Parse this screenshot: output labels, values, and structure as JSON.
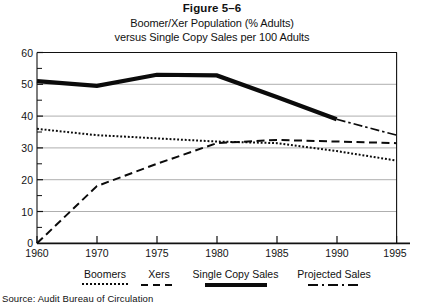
{
  "figure": {
    "number_label": "Figure 5–6",
    "subtitle_line_1": "Boomer/Xer Population (% Adults)",
    "subtitle_line_2": "versus Single Copy Sales per 100 Adults",
    "source_note": "Source: Audit Bureau of Circulation"
  },
  "legend": {
    "position": "bottom",
    "entries": [
      {
        "label": "Boomers",
        "style": "dotted",
        "color": "#0b0b0b"
      },
      {
        "label": "Xers",
        "style": "dashed",
        "color": "#0b0b0b"
      },
      {
        "label": "Single Copy Sales",
        "style": "solid-thick",
        "color": "#0b0b0b"
      },
      {
        "label": "Projected Sales",
        "style": "dash-dot",
        "color": "#0b0b0b"
      }
    ]
  },
  "chart_data": {
    "type": "line",
    "title": "Boomer/Xer Population (% Adults) versus Single Copy Sales per 100 Adults",
    "subtitle": "Figure 5–6",
    "xlabel": "",
    "ylabel": "",
    "x": [
      1960,
      1970,
      1975,
      1980,
      1985,
      1990,
      1995
    ],
    "categories": [
      "1960",
      "1970",
      "1975",
      "1980",
      "1985",
      "1990",
      "1995"
    ],
    "xtick_labels": [
      "1960",
      "1970",
      "1975",
      "1980",
      "1985",
      "1990",
      "1995"
    ],
    "ytick_labels": [
      "0",
      "10",
      "20",
      "30",
      "40",
      "50",
      "60"
    ],
    "ylim": [
      0,
      60
    ],
    "ytick_step": 10,
    "y_minor_step": 5,
    "grid": true,
    "grid_axis": "y",
    "legend_position": "bottom",
    "series": [
      {
        "name": "Single Copy Sales",
        "style": "solid-thick",
        "x": [
          1960,
          1970,
          1975,
          1980,
          1985,
          1990
        ],
        "values": [
          51,
          49.5,
          53,
          52.8,
          46,
          39
        ]
      },
      {
        "name": "Projected Sales",
        "style": "dash-dot",
        "x": [
          1990,
          1995
        ],
        "values": [
          39,
          34
        ]
      },
      {
        "name": "Boomers",
        "style": "dotted",
        "x": [
          1960,
          1970,
          1975,
          1980,
          1985,
          1990,
          1995
        ],
        "values": [
          36,
          34,
          33,
          32,
          31.5,
          29,
          26
        ]
      },
      {
        "name": "Xers",
        "style": "dashed",
        "x": [
          1960,
          1970,
          1975,
          1980,
          1985,
          1990,
          1995
        ],
        "values": [
          0,
          18,
          25,
          31.5,
          32.5,
          32,
          31.5
        ]
      }
    ]
  }
}
